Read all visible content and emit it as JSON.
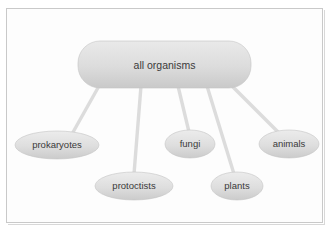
{
  "figure": {
    "type": "concept-map",
    "background_color": "#ffffff",
    "frame_border_color": "#c9c9c9",
    "connector_color": "#dcdcdc",
    "node_fill_light": "#e6e6e6",
    "node_fill_dark": "#cfcfcf",
    "label_color": "#3a3a3a"
  },
  "root": {
    "label": "all organisms",
    "shape": "rounded-rectangle",
    "x": 78,
    "y": 41,
    "width": 173,
    "height": 47,
    "center_x": 164,
    "center_y": 65
  },
  "children": [
    {
      "id": "prokaryotes",
      "label": "prokaryotes",
      "shape": "ellipse",
      "center_x": 57,
      "center_y": 145,
      "rx": 42,
      "ry": 14
    },
    {
      "id": "protoctists",
      "label": "protoctists",
      "shape": "ellipse",
      "center_x": 134,
      "center_y": 186,
      "rx": 39,
      "ry": 14
    },
    {
      "id": "fungi",
      "label": "fungi",
      "shape": "ellipse",
      "center_x": 190,
      "center_y": 144,
      "rx": 25,
      "ry": 14
    },
    {
      "id": "plants",
      "label": "plants",
      "shape": "ellipse",
      "center_x": 237,
      "center_y": 186,
      "rx": 26,
      "ry": 14
    },
    {
      "id": "animals",
      "label": "animals",
      "shape": "ellipse",
      "center_x": 289,
      "center_y": 144,
      "rx": 30,
      "ry": 14
    }
  ],
  "connectors": [
    {
      "id": "root-to-prokaryotes",
      "from": "all organisms",
      "to": "prokaryotes",
      "x1": 99,
      "y1": 88,
      "x2": 72,
      "y2": 132
    },
    {
      "id": "root-to-protoctists",
      "from": "all organisms",
      "to": "protoctists",
      "x1": 141,
      "y1": 88,
      "x2": 134,
      "y2": 172
    },
    {
      "id": "root-to-fungi",
      "from": "all organisms",
      "to": "fungi",
      "x1": 178,
      "y1": 88,
      "x2": 189,
      "y2": 130
    },
    {
      "id": "root-to-plants",
      "from": "all organisms",
      "to": "plants",
      "x1": 207,
      "y1": 88,
      "x2": 234,
      "y2": 172
    },
    {
      "id": "root-to-animals",
      "from": "all organisms",
      "to": "animals",
      "x1": 232,
      "y1": 88,
      "x2": 279,
      "y2": 131
    }
  ]
}
